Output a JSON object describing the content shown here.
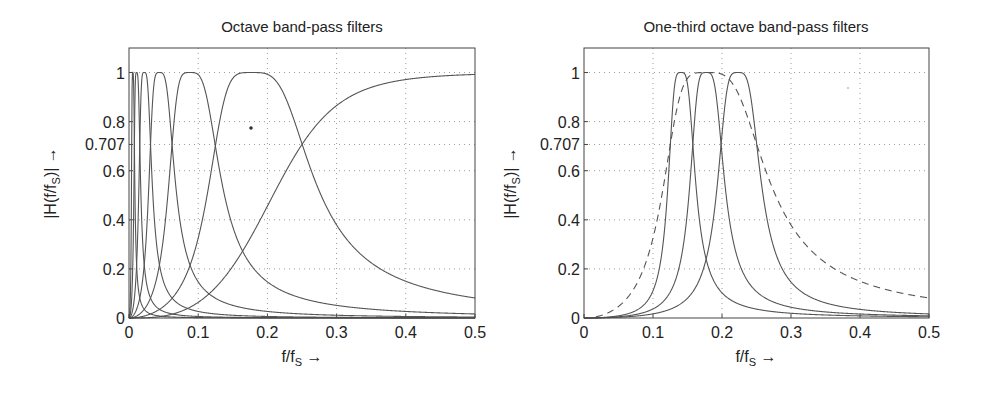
{
  "chart_data": [
    {
      "type": "line",
      "title": "Octave band-pass filters",
      "xlabel": "f/f_S →",
      "ylabel": "|H(f/f_S)| →",
      "xlim": [
        0,
        0.5
      ],
      "ylim": [
        0,
        1.1
      ],
      "xticks": [
        0,
        0.1,
        0.2,
        0.3,
        0.4,
        0.5
      ],
      "xtick_labels": [
        "0",
        "0.1",
        "0.2",
        "0.3",
        "0.4",
        "0.5"
      ],
      "yticks": [
        0,
        0.2,
        0.4,
        0.6,
        0.707,
        0.8,
        1
      ],
      "ytick_labels": [
        "0",
        "0.2",
        "0.4",
        "0.6",
        "0.707",
        "0.8",
        "1"
      ],
      "grid": true,
      "legend": null,
      "series": [
        {
          "name": "octave band 1",
          "kind": "bandpass",
          "center": 0.0055,
          "style": "solid"
        },
        {
          "name": "octave band 2",
          "kind": "bandpass",
          "center": 0.011,
          "style": "solid"
        },
        {
          "name": "octave band 3",
          "kind": "bandpass",
          "center": 0.022,
          "style": "solid"
        },
        {
          "name": "octave band 4",
          "kind": "bandpass",
          "center": 0.044,
          "style": "solid"
        },
        {
          "name": "octave band 5",
          "kind": "bandpass",
          "center": 0.088,
          "style": "solid"
        },
        {
          "name": "octave band 6",
          "kind": "bandpass",
          "center": 0.177,
          "style": "solid"
        },
        {
          "name": "high-pass",
          "kind": "highpass",
          "cutoff": 0.25,
          "style": "solid"
        }
      ],
      "crossover_level": 0.707
    },
    {
      "type": "line",
      "title": "One-third octave band-pass filters",
      "xlabel": "f/f_S →",
      "ylabel": "|H(f/f_S)| →",
      "xlim": [
        0,
        0.5
      ],
      "ylim": [
        0,
        1.1
      ],
      "xticks": [
        0,
        0.1,
        0.2,
        0.3,
        0.4,
        0.5
      ],
      "xtick_labels": [
        "0",
        "0.1",
        "0.2",
        "0.3",
        "0.4",
        "0.5"
      ],
      "yticks": [
        0,
        0.2,
        0.4,
        0.6,
        0.707,
        0.8,
        1
      ],
      "ytick_labels": [
        "0",
        "0.2",
        "0.4",
        "0.6",
        "0.707",
        "0.8",
        "1"
      ],
      "grid": true,
      "legend": null,
      "series": [
        {
          "name": "one-third octave band 1",
          "kind": "bandpass",
          "center": 0.1405,
          "bw_ratio": 1.26,
          "style": "solid"
        },
        {
          "name": "one-third octave band 2",
          "kind": "bandpass",
          "center": 0.177,
          "bw_ratio": 1.26,
          "style": "solid"
        },
        {
          "name": "one-third octave band 3",
          "kind": "bandpass",
          "center": 0.223,
          "bw_ratio": 1.26,
          "style": "solid"
        },
        {
          "name": "octave band (reference)",
          "kind": "bandpass",
          "center": 0.177,
          "bw_ratio": 2.0,
          "style": "dashed"
        }
      ],
      "crossover_level": 0.707
    }
  ],
  "plots": {
    "left": {
      "title": "Octave band-pass filters",
      "ylabel_main": "|H(f/f",
      "ylabel_sub": "S",
      "ylabel_end": ")| →",
      "xlabel_main": "f/f",
      "xlabel_sub": "S",
      "xlabel_end": " →"
    },
    "right": {
      "title": "One-third octave band-pass filters",
      "ylabel_main": "|H(f/f",
      "ylabel_sub": "S",
      "ylabel_end": ")| →",
      "xlabel_main": "f/f",
      "xlabel_sub": "S",
      "xlabel_end": " →"
    }
  },
  "colors": {
    "curve": "#555555",
    "axis": "#444444",
    "grid": "#9a9a9a",
    "background": "#ffffff"
  }
}
